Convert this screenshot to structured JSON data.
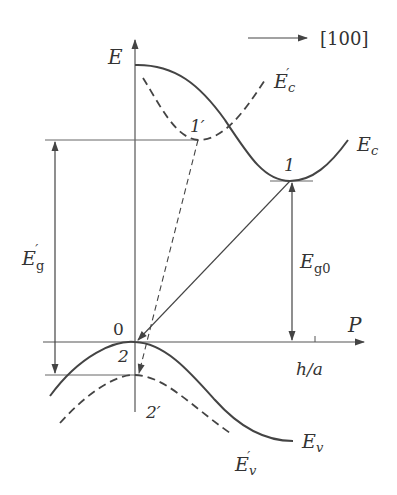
{
  "diagram": {
    "direction_label": "[100]",
    "axes": {
      "y_label": "E",
      "x_label": "P",
      "x_tick_label": "h/a",
      "origin_label": "0"
    },
    "curves": {
      "conduction_band": "E",
      "conduction_band_sub": "c",
      "conduction_band_alt": "E",
      "conduction_band_alt_sub": "c",
      "valence_band": "E",
      "valence_band_sub": "v",
      "valence_band_alt": "E",
      "valence_band_alt_sub": "v"
    },
    "points": {
      "p1": "1",
      "p1_prime": "1′",
      "p2": "2",
      "p2_prime": "2′"
    },
    "gaps": {
      "eg_prime": "E",
      "eg_prime_sub": "g",
      "eg0": "E",
      "eg0_sub": "g0"
    },
    "colors": {
      "line": "#444444",
      "text": "#333333",
      "background": "#ffffff"
    }
  }
}
